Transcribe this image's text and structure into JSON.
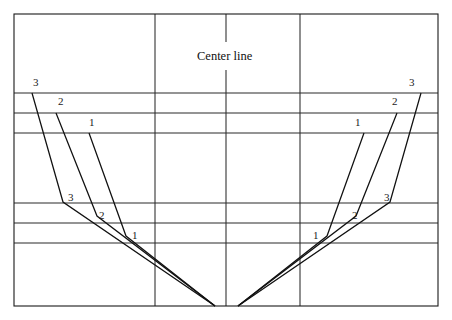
{
  "drawing": {
    "title_caption": "Center line",
    "canvas": {
      "width": 452,
      "height": 320
    },
    "colors": {
      "background": "#ffffff",
      "border": "#1a1a1a",
      "grid": "#2a2a2a",
      "hull": "#111111",
      "text": "#1a1a1a"
    },
    "frame": {
      "x": 14,
      "y": 14,
      "width": 424,
      "height": 292
    },
    "grid": {
      "horizontal_y": [
        93,
        113,
        133,
        203,
        223,
        243
      ],
      "vertical_x": [
        155,
        300
      ],
      "centerline_x": 226,
      "centerline_segments": [
        {
          "y1": 14,
          "y2": 42
        },
        {
          "y1": 70,
          "y2": 306
        }
      ]
    },
    "hull_lines": [
      {
        "id": "left-1",
        "side": "left",
        "station": "1",
        "points": "89,133 126,236 215,306"
      },
      {
        "id": "left-2",
        "side": "left",
        "station": "2",
        "points": "56,113 97,216 215,306"
      },
      {
        "id": "left-3",
        "side": "left",
        "station": "3",
        "points": "32,93 63,202 215,306"
      },
      {
        "id": "right-1",
        "side": "right",
        "station": "1",
        "points": "364,133 327,236 238,306"
      },
      {
        "id": "right-2",
        "side": "right",
        "station": "2",
        "points": "397,113 356,216 238,306"
      },
      {
        "id": "right-3",
        "side": "right",
        "station": "3",
        "points": "421,93 390,202 238,306"
      }
    ],
    "station_labels": [
      {
        "id": "lbl-left-top-3",
        "text": "3",
        "x": 33,
        "y": 77
      },
      {
        "id": "lbl-left-top-2",
        "text": "2",
        "x": 58,
        "y": 96
      },
      {
        "id": "lbl-left-top-1",
        "text": "1",
        "x": 89,
        "y": 117
      },
      {
        "id": "lbl-left-bot-3",
        "text": "3",
        "x": 68,
        "y": 192
      },
      {
        "id": "lbl-left-bot-2",
        "text": "2",
        "x": 99,
        "y": 210
      },
      {
        "id": "lbl-left-bot-1",
        "text": "1",
        "x": 132,
        "y": 230
      },
      {
        "id": "lbl-right-top-3",
        "text": "3",
        "x": 409,
        "y": 77
      },
      {
        "id": "lbl-right-top-2",
        "text": "2",
        "x": 392,
        "y": 96
      },
      {
        "id": "lbl-right-top-1",
        "text": "1",
        "x": 355,
        "y": 117
      },
      {
        "id": "lbl-right-bot-3",
        "text": "3",
        "x": 384,
        "y": 192
      },
      {
        "id": "lbl-right-bot-2",
        "text": "2",
        "x": 352,
        "y": 210
      },
      {
        "id": "lbl-right-bot-1",
        "text": "1",
        "x": 313,
        "y": 230
      }
    ],
    "center_caption": {
      "text": "Center line",
      "x": 197,
      "y": 50
    }
  }
}
